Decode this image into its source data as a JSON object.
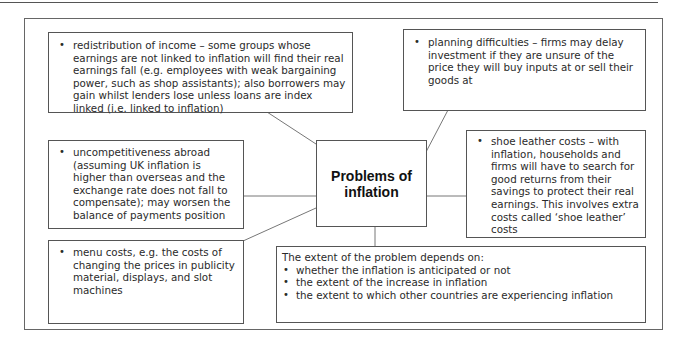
{
  "diagram": {
    "title": "Problems of inflation",
    "title_lines": [
      "Problems of",
      "inflation"
    ],
    "nodes": [
      {
        "id": "redistribution",
        "text": "redistribution of income – some groups whose earnings are not linked to inflation will find their real earnings fall (e.g. employees with weak bargaining power, such as shop assistants); also borrowers may gain whilst lenders lose unless loans are index linked (i.e. linked to inflation)"
      },
      {
        "id": "planning",
        "text": "planning difficulties – firms may delay investment if they are unsure of the price they will buy inputs at or sell their goods at"
      },
      {
        "id": "uncompetitiveness",
        "text": "uncompetitiveness abroad (assuming UK inflation is higher than overseas and the exchange rate does not fall to compensate); may worsen the balance of payments position"
      },
      {
        "id": "shoe-leather",
        "text": "shoe leather costs – with inflation, households and firms will have to search for good returns from their savings to protect their real earnings. This involves extra costs called ‘shoe leather’ costs"
      },
      {
        "id": "menu-costs",
        "text": "menu costs, e.g. the costs of changing the prices in publicity material, displays, and slot machines"
      }
    ],
    "extent": {
      "lead": "The extent of the problem depends on:",
      "items": [
        "whether the inflation is anticipated or not",
        "the extent of the increase in inflation",
        "the extent to which other countries are experiencing inflation"
      ]
    }
  }
}
